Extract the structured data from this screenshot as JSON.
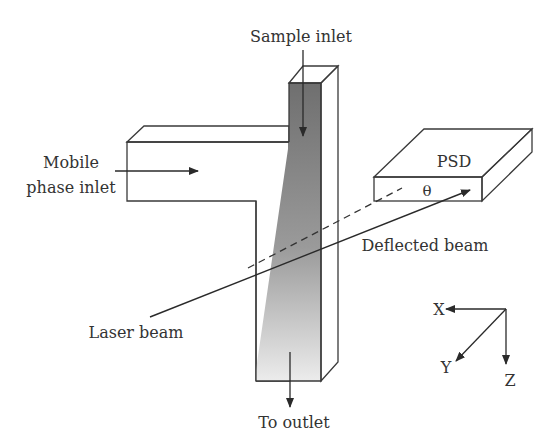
{
  "figure": {
    "type": "schematic",
    "colors": {
      "line": "#3a3a3a",
      "text": "#333333",
      "column_dark": "#7a7a7a",
      "column_light": "#e6e6e6",
      "column_side": "#6e6e6e",
      "background": "#ffffff"
    }
  },
  "labels": {
    "sample_inlet": "Sample inlet",
    "mobile_phase_line1": "Mobile",
    "mobile_phase_line2": "phase inlet",
    "psd": "PSD",
    "theta": "θ",
    "deflected_beam": "Deflected beam",
    "laser_beam": "Laser beam",
    "to_outlet": "To outlet"
  },
  "axes": {
    "x": "X",
    "y": "Y",
    "z": "Z"
  }
}
